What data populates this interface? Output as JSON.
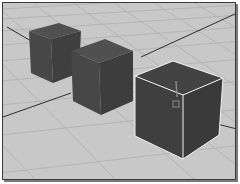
{
  "viewport": {
    "type": "3d-perspective",
    "background_color": "#c9c9c9",
    "grid_line_color": "#b3b3b3",
    "axis_line_color": "#2e2e2e",
    "border_color": "#3a3a3a"
  },
  "objects": [
    {
      "name": "cube-1",
      "selected": false,
      "color": "#4a4a4a"
    },
    {
      "name": "cube-2",
      "selected": false,
      "color": "#4a4a4a"
    },
    {
      "name": "cube-3",
      "selected": true,
      "color": "#3e3e3e",
      "selection_color": "#f2f2f2"
    }
  ],
  "manipulator": {
    "icon": "pivot-icon",
    "color": "#8c8c8c"
  }
}
